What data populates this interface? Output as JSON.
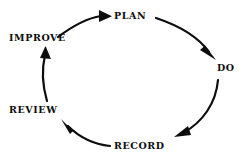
{
  "diagram": {
    "type": "cycle",
    "direction": "clockwise",
    "background_color": "#ffffff",
    "stroke_color": "#0d0d0d",
    "stages": [
      {
        "id": "plan",
        "label": "PLAN",
        "order": 1,
        "position": "top"
      },
      {
        "id": "do",
        "label": "DO",
        "order": 2,
        "position": "right"
      },
      {
        "id": "record",
        "label": "RECORD",
        "order": 3,
        "position": "bottom"
      },
      {
        "id": "review",
        "label": "REVIEW",
        "order": 4,
        "position": "bottom-left"
      },
      {
        "id": "improve",
        "label": "IMPROVE",
        "order": 5,
        "position": "top-left"
      }
    ],
    "arrows": [
      {
        "id": "arrow-improve-plan",
        "from": "IMPROVE",
        "to": "PLAN",
        "icon": "curved-arrow-icon"
      },
      {
        "id": "arrow-plan-do",
        "from": "PLAN",
        "to": "DO",
        "icon": "curved-arrow-icon"
      },
      {
        "id": "arrow-do-record",
        "from": "DO",
        "to": "RECORD",
        "icon": "curved-arrow-icon"
      },
      {
        "id": "arrow-record-review",
        "from": "RECORD",
        "to": "REVIEW",
        "icon": "curved-arrow-icon"
      },
      {
        "id": "arrow-review-improve",
        "from": "REVIEW",
        "to": "IMPROVE",
        "icon": "curved-arrow-icon"
      }
    ]
  }
}
